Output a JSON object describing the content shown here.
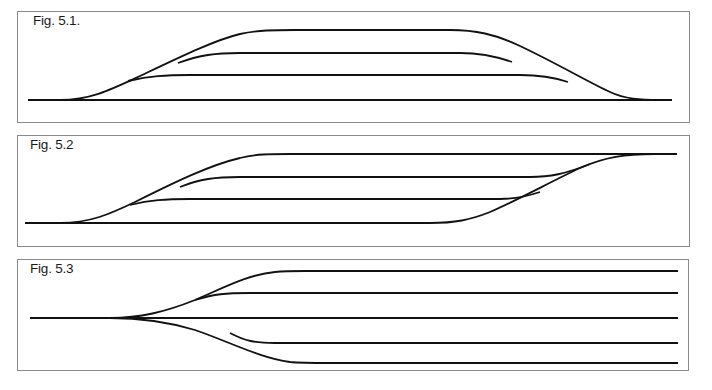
{
  "figures": [
    {
      "id": "fig-5-1",
      "label": "Fig. 5.1.",
      "description": "Ladder track: main line with three parallel tracks branching off and rejoining symmetrically",
      "box": {
        "x": 17,
        "y": 11,
        "w": 673,
        "h": 112
      },
      "track_levels_y": [
        30,
        53,
        75,
        100
      ],
      "main_line": {
        "x_start": 28,
        "x_end": 672,
        "y": 100
      }
    },
    {
      "id": "fig-5-2",
      "label": "Fig. 5.2",
      "description": "Parallel tracks diverging from the lower main line on the left and converging into the upper line on the right",
      "box": {
        "x": 17,
        "y": 135,
        "w": 673,
        "h": 112
      },
      "track_levels_y": [
        154,
        177,
        199,
        223
      ],
      "main_line": {
        "x_start": 25,
        "x_end": 677
      }
    },
    {
      "id": "fig-5-3",
      "label": "Fig. 5.3",
      "description": "Single track fanning out into five parallel tracks",
      "box": {
        "x": 17,
        "y": 259,
        "w": 672,
        "h": 112
      },
      "track_levels_y": [
        271,
        293,
        318,
        343,
        363
      ],
      "main_line": {
        "x_start": 30,
        "x_end": 678,
        "y": 318
      }
    }
  ],
  "colors": {
    "line": "#111111",
    "border": "#8a8a8a",
    "background": "#ffffff",
    "text": "#1a1a1a"
  }
}
